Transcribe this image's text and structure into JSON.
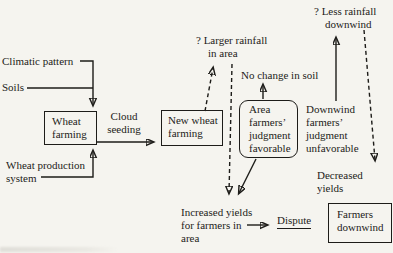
{
  "figure": {
    "type": "causal-flow-diagram",
    "topic": "Cloud seeding and wheat farming outcomes",
    "colors": {
      "paper": "#f5f4ef",
      "ink": "#1d1c19"
    },
    "labels": {
      "climatic_pattern": "Climatic pattern",
      "soils": "Soils",
      "wheat_production": [
        "Wheat production",
        "system"
      ],
      "wheat_farming": [
        "Wheat",
        "farming"
      ],
      "cloud_seeding": [
        "Cloud",
        "seeding"
      ],
      "new_wheat_farming": [
        "New wheat",
        "farming"
      ],
      "larger_rainfall": [
        "? Larger rainfall",
        "in area"
      ],
      "no_change_soil": "No change in soil",
      "area_farmers": [
        "Area",
        "farmers’",
        "judgment",
        "favorable"
      ],
      "downwind_judgment": [
        "Downwind",
        "farmers’",
        "judgment",
        "unfavorable"
      ],
      "less_rainfall": [
        "? Less rainfall",
        "downwind"
      ],
      "decreased_yields": [
        "Decreased",
        "yields"
      ],
      "increased_yields": [
        "Increased yields",
        "for farmers in",
        "area"
      ],
      "dispute": "Dispute",
      "farmers_downwind": [
        "Farmers",
        "downwind"
      ]
    },
    "edges": [
      "climatic-pattern + soils -> wheat-farming (solid)",
      "wheat-production-system -> wheat-farming (solid)",
      "wheat-farming -> new-wheat-farming via cloud seeding (solid)",
      "new-wheat-farming -> larger-rainfall-in-area (dashed, questioned)",
      "larger-rainfall-in-area -> increased-yields (dashed, questioned)",
      "area-farmers-judgment -> no-change-in-soil (solid)",
      "area-farmers-judgment -> increased-yields (solid)",
      "increased-yields -> dispute (solid)",
      "downwind-judgment -> less-rainfall-downwind (solid)",
      "less-rainfall-downwind -> decreased-yields (dashed, questioned)"
    ]
  }
}
